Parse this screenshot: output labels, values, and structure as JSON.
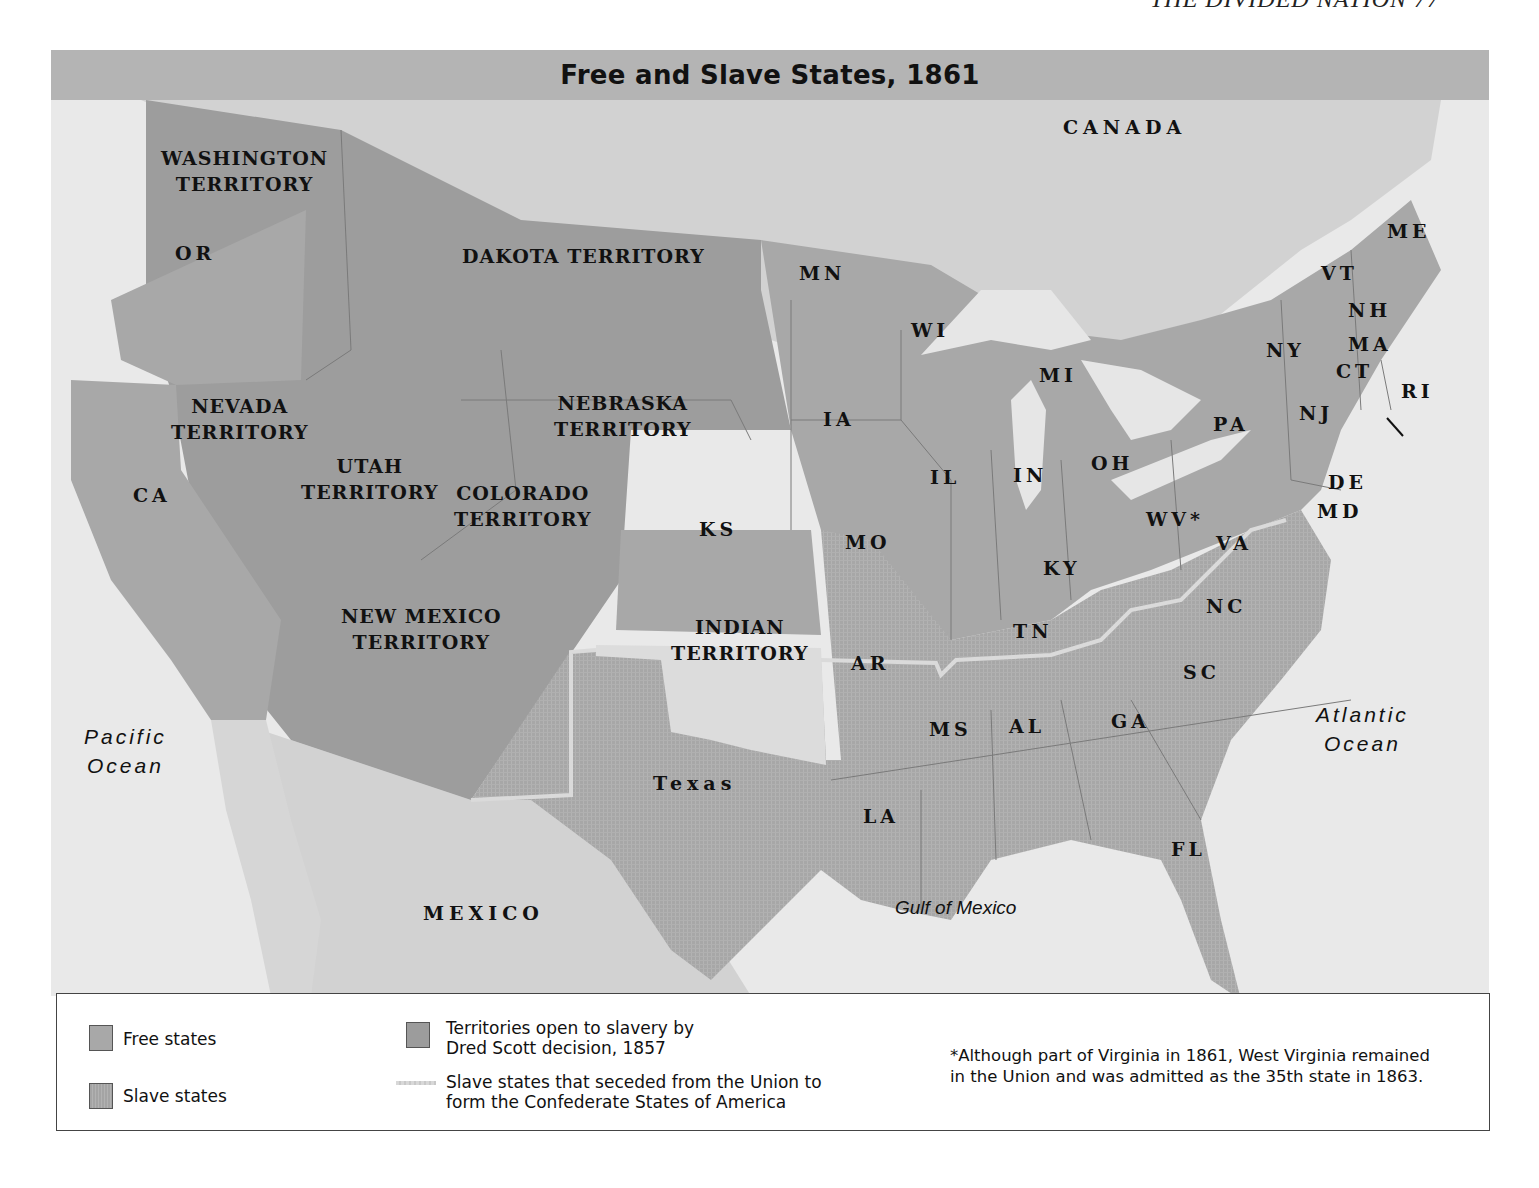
{
  "running_head": "THE DIVIDED NATION   77",
  "map": {
    "title": "Free and Slave States, 1861",
    "colors": {
      "water": "#e9e9e9",
      "foreign_land": "#d0d0d0",
      "free_state": "#a8a8a8",
      "slave_state": "#a6a6a6",
      "territory_open": "#9c9c9c",
      "indian_territory": "#dcdcdc",
      "title_bar": "#b4b4b4",
      "secession_line": "#d9d9d9"
    },
    "region_labels": {
      "canada": "CANADA",
      "mexico": "MEXICO"
    },
    "water_labels": {
      "pacific": [
        "Pacific",
        "Ocean"
      ],
      "atlantic": [
        "Atlantic",
        "Ocean"
      ],
      "gulf": "Gulf of Mexico"
    },
    "territories": [
      {
        "id": "washington",
        "lines": [
          "WASHINGTON",
          "TERRITORY"
        ],
        "category": "territory_open"
      },
      {
        "id": "dakota",
        "lines": [
          "DAKOTA TERRITORY"
        ],
        "category": "territory_open"
      },
      {
        "id": "nevada",
        "lines": [
          "NEVADA",
          "TERRITORY"
        ],
        "category": "territory_open"
      },
      {
        "id": "utah",
        "lines": [
          "UTAH",
          "TERRITORY"
        ],
        "category": "territory_open"
      },
      {
        "id": "colorado",
        "lines": [
          "COLORADO",
          "TERRITORY"
        ],
        "category": "territory_open"
      },
      {
        "id": "nebraska",
        "lines": [
          "NEBRASKA",
          "TERRITORY"
        ],
        "category": "territory_open"
      },
      {
        "id": "new_mexico",
        "lines": [
          "NEW MEXICO",
          "TERRITORY"
        ],
        "category": "territory_open"
      },
      {
        "id": "indian",
        "lines": [
          "INDIAN",
          "TERRITORY"
        ],
        "category": "indian_territory"
      }
    ],
    "free_states": [
      "OR",
      "CA",
      "MN",
      "WI",
      "MI",
      "IA",
      "KS",
      "IL",
      "IN",
      "OH",
      "PA",
      "NY",
      "NJ",
      "VT",
      "NH",
      "ME",
      "MA",
      "CT",
      "RI",
      "WV*"
    ],
    "slave_states": [
      "MO",
      "KY",
      "DE",
      "MD",
      "VA",
      "NC",
      "SC",
      "GA",
      "FL",
      "AL",
      "MS",
      "TN",
      "AR",
      "LA",
      "Texas"
    ],
    "state_labels": {
      "OR": "OR",
      "CA": "CA",
      "MN": "MN",
      "WI": "WI",
      "MI": "MI",
      "IA": "IA",
      "KS": "KS",
      "IL": "IL",
      "IN": "IN",
      "OH": "OH",
      "PA": "PA",
      "NY": "NY",
      "NJ": "NJ",
      "VT": "VT",
      "NH": "NH",
      "ME": "ME",
      "MA": "MA",
      "CT": "CT",
      "RI": "RI",
      "DE": "DE",
      "MD": "MD",
      "WV": "WV*",
      "VA": "VA",
      "KY": "KY",
      "MO": "MO",
      "TN": "TN",
      "NC": "NC",
      "SC": "SC",
      "GA": "GA",
      "AL": "AL",
      "MS": "MS",
      "AR": "AR",
      "LA": "LA",
      "FL": "FL",
      "TX": "Texas"
    }
  },
  "legend": {
    "items": [
      {
        "label": "Free states",
        "swatch": "free"
      },
      {
        "label": "Slave states",
        "swatch": "slave"
      },
      {
        "label_lines": [
          "Territories open to slavery by",
          "Dred Scott decision, 1857"
        ],
        "swatch": "territory"
      },
      {
        "label_lines": [
          "Slave states that seceded from the Union to",
          "form the Confederate States of America"
        ],
        "swatch": "secession-line"
      }
    ],
    "footnote_lines": [
      "*Although part of Virginia in 1861, West Virginia remained",
      "in the Union and was admitted as the 35th state in 1863."
    ]
  }
}
